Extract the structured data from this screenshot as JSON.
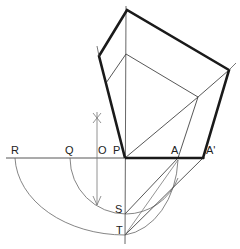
{
  "diagram": {
    "type": "geometric-construction",
    "colors": {
      "ink": "#1a1a1a",
      "thin": "#555555",
      "faint": "#888888",
      "background": "#ffffff"
    },
    "labels": {
      "R": "R",
      "Q": "Q",
      "O": "O",
      "P": "P",
      "A": "A",
      "A_prime": "A'",
      "S": "S",
      "T": "T"
    },
    "points": {
      "P": [
        125,
        158
      ],
      "A": [
        178,
        158
      ],
      "A_prime": [
        203,
        158
      ],
      "O": [
        97,
        158
      ],
      "Q": [
        70,
        158
      ],
      "R": [
        15,
        158
      ],
      "S": [
        125,
        214
      ],
      "T": [
        125,
        235
      ],
      "top": [
        127,
        10
      ],
      "left": [
        99,
        56
      ],
      "right": [
        229,
        70
      ],
      "inner_apex": [
        126,
        54
      ],
      "inner_right": [
        198,
        97
      ],
      "inner_left": [
        106,
        83
      ]
    }
  }
}
